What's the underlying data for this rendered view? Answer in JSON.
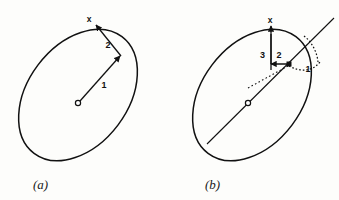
{
  "figure": {
    "background_color": "#fdfdfb",
    "ink_color": "#111111"
  },
  "panels": [
    {
      "id": "a",
      "caption": "(a)",
      "ellipse": {
        "center_x": 78,
        "center_y": 95,
        "radius_x": 73,
        "radius_y": 50,
        "rotation_deg": -53
      },
      "center_marker": "open-circle",
      "labels": [
        {
          "key": "axis",
          "text": "x"
        },
        {
          "key": "vector2",
          "text": "2"
        },
        {
          "key": "vector1",
          "text": "1"
        }
      ]
    },
    {
      "id": "b",
      "caption": "(b)",
      "ellipse": {
        "center_x": 252,
        "center_y": 95,
        "radius_x": 73,
        "radius_y": 50,
        "rotation_deg": -53
      },
      "center_marker": "open-circle",
      "point_marker": "filled-square",
      "labels": [
        {
          "key": "axis",
          "text": "x"
        },
        {
          "key": "vector3",
          "text": "3"
        },
        {
          "key": "vector2",
          "text": "2"
        },
        {
          "key": "vector1",
          "text": "1"
        }
      ]
    }
  ],
  "text": {
    "panel_a": {
      "axis_label": "x",
      "label_2": "2",
      "label_1": "1",
      "caption": "(a)"
    },
    "panel_b": {
      "axis_label": "x",
      "label_3": "3",
      "label_2": "2",
      "label_1": "1",
      "caption": "(b)"
    }
  },
  "colors": {
    "ink": "#111111",
    "background": "#fdfdfb"
  }
}
